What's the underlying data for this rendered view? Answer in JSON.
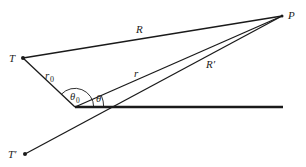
{
  "diagram": {
    "type": "geometry",
    "colors": {
      "line": "#1a1a1a",
      "text": "#222222",
      "background": "#ffffff"
    },
    "points": [
      {
        "id": "T",
        "label": "T",
        "x": 23,
        "y": 58
      },
      {
        "id": "P",
        "label": "P",
        "x": 282,
        "y": 16
      },
      {
        "id": "T_prime",
        "label": "T′",
        "x": 25,
        "y": 154
      },
      {
        "id": "O",
        "label": "",
        "x": 75,
        "y": 107
      }
    ],
    "segments": [
      {
        "from": "T",
        "to": "P",
        "label": "R"
      },
      {
        "from": "T",
        "to": "O",
        "label": "r0"
      },
      {
        "from": "O",
        "to": "P",
        "label": "r"
      },
      {
        "from": "T_prime",
        "to": "P",
        "label": "R′"
      },
      {
        "from": "O",
        "to": "end",
        "label": "",
        "note": "horizontal reference line (thick)"
      }
    ],
    "angles": [
      {
        "label": "θ0",
        "vertex": "O",
        "between": [
          "O-T",
          "horizontal"
        ]
      },
      {
        "label": "θ",
        "vertex": "O",
        "between": [
          "O-P",
          "horizontal"
        ]
      }
    ]
  },
  "labels": {
    "T": "T",
    "P": "P",
    "T_prime": "T′",
    "R": "R",
    "R_prime": "R′",
    "r": "r",
    "r0_base": "r",
    "r0_sub": "0",
    "theta0_base": "θ",
    "theta0_sub": "0",
    "theta": "θ"
  }
}
